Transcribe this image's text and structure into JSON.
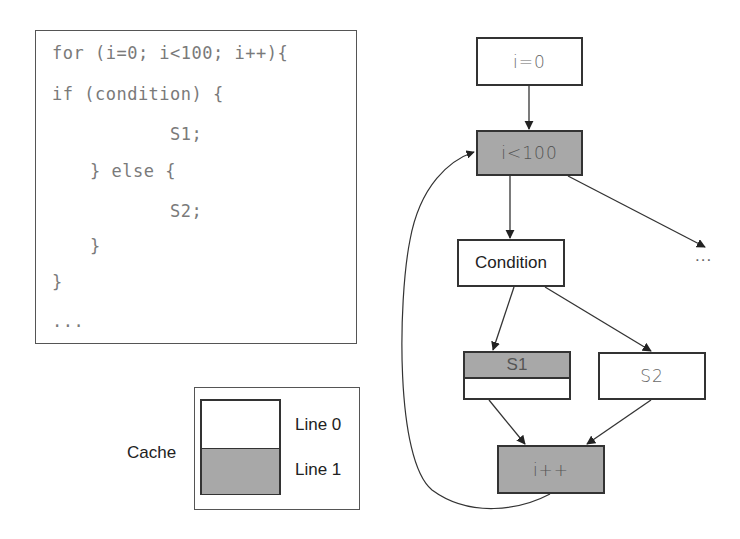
{
  "code": {
    "lines": [
      "for (i=0; i<100; i++){",
      "if (condition) {",
      "S1;",
      "} else {",
      "S2;",
      "}",
      "}",
      "..."
    ]
  },
  "cache": {
    "label": "Cache",
    "lines": [
      "Line 0",
      "Line 1"
    ],
    "line_fill": [
      "#ffffff",
      "#a8a8a8"
    ]
  },
  "flowchart": {
    "nodes": {
      "init": "i=0",
      "loop_check": "i<100",
      "condition": "Condition",
      "s1": "S1",
      "s2": "S2",
      "increment": "i++"
    },
    "exit_label": "...",
    "highlight_color": "#a8a8a8",
    "edges": [
      {
        "from": "init",
        "to": "loop_check"
      },
      {
        "from": "loop_check",
        "to": "condition"
      },
      {
        "from": "loop_check",
        "to": "exit"
      },
      {
        "from": "condition",
        "to": "s1"
      },
      {
        "from": "condition",
        "to": "s2"
      },
      {
        "from": "s1",
        "to": "increment"
      },
      {
        "from": "s2",
        "to": "increment"
      },
      {
        "from": "increment",
        "to": "loop_check"
      }
    ]
  }
}
